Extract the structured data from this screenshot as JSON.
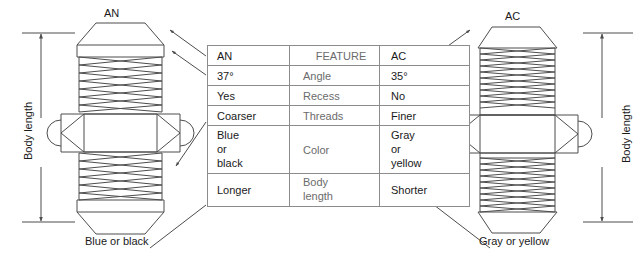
{
  "diagram": {
    "title_left": "AN",
    "title_right": "AC",
    "caption_left": "Blue or black",
    "caption_right": "Gray or yellow",
    "dimension_label_left": "Body length",
    "dimension_label_right": "Body length",
    "line_color": "#4d4d4d",
    "text_color": "#1a1a1a",
    "feature_text_color": "#6b6b6b",
    "table_border_color": "#8c8c8c"
  },
  "table": {
    "header": {
      "left": "AN",
      "center": "FEATURE",
      "right": "AC",
      "left_arrow": "◄",
      "right_arrow": "►"
    },
    "rows": [
      {
        "an": "37°",
        "feature": "Angle",
        "ac": "35°"
      },
      {
        "an": "Yes",
        "feature": "Recess",
        "ac": "No"
      },
      {
        "an": "Coarser",
        "feature": "Threads",
        "ac": "Finer"
      },
      {
        "an": "Blue\nor\nblack",
        "feature": "Color",
        "ac": "Gray\nor\nyellow"
      },
      {
        "an": "Longer",
        "feature": "Body\nlength",
        "ac": "Shorter"
      }
    ]
  },
  "fittings": {
    "left": {
      "name": "AN flare fitting",
      "thread_style": "coarse",
      "has_recess": true,
      "flare_angle": "37°",
      "color": "Blue or black"
    },
    "right": {
      "name": "AC flare fitting",
      "thread_style": "fine",
      "has_recess": false,
      "flare_angle": "35°",
      "color": "Gray or yellow"
    }
  }
}
